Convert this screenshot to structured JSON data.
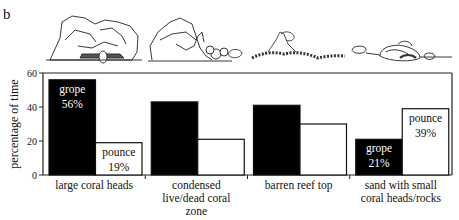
{
  "panel_label": "b",
  "chart_data": {
    "type": "bar",
    "title": "",
    "xlabel": "",
    "ylabel": "percentage of time",
    "ylim": [
      0,
      60
    ],
    "yticks": [
      0,
      20,
      40,
      60
    ],
    "grid": false,
    "legend": "none (series labelled directly on bars)",
    "categories": [
      [
        "large coral heads"
      ],
      [
        "condensed",
        "live/dead coral",
        "zone"
      ],
      [
        "barren reef top"
      ],
      [
        "sand with small",
        "coral heads/rocks"
      ]
    ],
    "series": [
      {
        "name": "grope",
        "fill": "#000000",
        "values": [
          56,
          43,
          41,
          21
        ]
      },
      {
        "name": "pounce",
        "fill": "#ffffff",
        "values": [
          19,
          21,
          30,
          39
        ]
      }
    ],
    "annotations": [
      {
        "category": 0,
        "series": "grope",
        "lines": [
          "grope",
          "56%"
        ]
      },
      {
        "category": 0,
        "series": "pounce",
        "lines": [
          "pounce",
          "19%"
        ]
      },
      {
        "category": 3,
        "series": "grope",
        "lines": [
          "grope",
          "21%"
        ]
      },
      {
        "category": 3,
        "series": "pounce",
        "lines": [
          "pounce",
          "39%"
        ]
      }
    ],
    "illustrations": [
      "large-coral-heads-sketch",
      "condensed-coral-sketch",
      "barren-reef-top-sketch",
      "sand-with-small-coral-heads-sketch"
    ]
  }
}
